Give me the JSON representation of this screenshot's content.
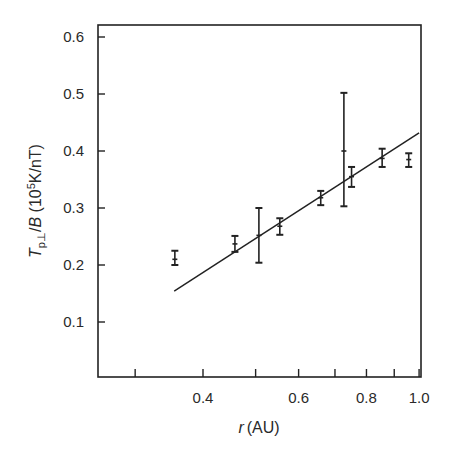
{
  "chart_data": {
    "type": "scatter",
    "title": "",
    "xlabel": {
      "var": "r",
      "unit": "(AU)"
    },
    "ylabel": {
      "var": "T",
      "sub": "p⊥",
      "slash": "/",
      "var2": "B",
      "unit_pre": " (10",
      "unit_exp": "5",
      "unit_post": "K/nT)"
    },
    "xscale": "log",
    "xlim": [
      0.255,
      1.0
    ],
    "ylim": [
      0.0,
      0.62
    ],
    "grid": false,
    "legend": null,
    "x_ticks": [
      0.3,
      0.4,
      0.5,
      0.6,
      0.7,
      0.8,
      0.9,
      1.0
    ],
    "x_tick_labels": [
      {
        "value": 0.4,
        "label": "0.4"
      },
      {
        "value": 0.6,
        "label": "0.6"
      },
      {
        "value": 0.8,
        "label": "0.8"
      },
      {
        "value": 1.0,
        "label": "1.0"
      }
    ],
    "y_ticks": [
      {
        "value": 0.1,
        "label": "0.1"
      },
      {
        "value": 0.2,
        "label": "0.2"
      },
      {
        "value": 0.3,
        "label": "0.3"
      },
      {
        "value": 0.4,
        "label": "0.4"
      },
      {
        "value": 0.5,
        "label": "0.5"
      },
      {
        "value": 0.6,
        "label": "0.6"
      }
    ],
    "series": [
      {
        "name": "measurements",
        "style": "error-bars",
        "points": [
          {
            "x": 0.355,
            "y": 0.21,
            "ylow": 0.2,
            "yhigh": 0.225
          },
          {
            "x": 0.458,
            "y": 0.237,
            "ylow": 0.223,
            "yhigh": 0.251
          },
          {
            "x": 0.507,
            "y": 0.252,
            "ylow": 0.204,
            "yhigh": 0.3
          },
          {
            "x": 0.554,
            "y": 0.268,
            "ylow": 0.253,
            "yhigh": 0.282
          },
          {
            "x": 0.659,
            "y": 0.318,
            "ylow": 0.305,
            "yhigh": 0.33
          },
          {
            "x": 0.727,
            "y": 0.4,
            "ylow": 0.303,
            "yhigh": 0.502
          },
          {
            "x": 0.751,
            "y": 0.355,
            "ylow": 0.337,
            "yhigh": 0.372
          },
          {
            "x": 0.855,
            "y": 0.387,
            "ylow": 0.372,
            "yhigh": 0.404
          },
          {
            "x": 0.957,
            "y": 0.385,
            "ylow": 0.372,
            "yhigh": 0.396
          }
        ]
      },
      {
        "name": "fit",
        "style": "line",
        "points": [
          {
            "x": 0.354,
            "y": 0.154
          },
          {
            "x": 1.0,
            "y": 0.432
          }
        ]
      }
    ]
  }
}
